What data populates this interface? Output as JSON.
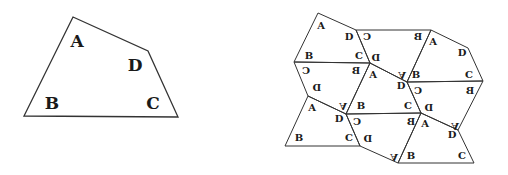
{
  "figure": {
    "colors": {
      "stroke": "#333333",
      "text": "#1a1a1a",
      "background": "#ffffff"
    }
  },
  "quadrilateral": {
    "points": [
      [
        73,
        17
      ],
      [
        148,
        51
      ],
      [
        178,
        117
      ],
      [
        24,
        116
      ]
    ],
    "labels": [
      {
        "text": "A",
        "x": 77,
        "y": 47,
        "size": 17,
        "rot": 0,
        "flipX": false
      },
      {
        "text": "D",
        "x": 135,
        "y": 71,
        "size": 17,
        "rot": 0,
        "flipX": false
      },
      {
        "text": "B",
        "x": 52,
        "y": 109,
        "size": 17,
        "rot": 0,
        "flipX": false
      },
      {
        "text": "C",
        "x": 153,
        "y": 109,
        "size": 17,
        "rot": 0,
        "flipX": false
      }
    ]
  },
  "tiling": {
    "tiles": [
      {
        "points": [
          [
            318,
            13
          ],
          [
            356,
            30
          ],
          [
            370,
            63
          ],
          [
            294,
            62
          ]
        ]
      },
      {
        "points": [
          [
            356,
            30
          ],
          [
            431,
            30
          ],
          [
            407,
            82
          ],
          [
            370,
            63
          ]
        ]
      },
      {
        "points": [
          [
            431,
            30
          ],
          [
            468,
            48
          ],
          [
            483,
            81
          ],
          [
            407,
            82
          ]
        ]
      },
      {
        "points": [
          [
            294,
            62
          ],
          [
            370,
            63
          ],
          [
            346,
            114
          ],
          [
            308,
            96
          ]
        ]
      },
      {
        "points": [
          [
            370,
            63
          ],
          [
            407,
            82
          ],
          [
            421,
            113
          ],
          [
            346,
            114
          ]
        ]
      },
      {
        "points": [
          [
            407,
            82
          ],
          [
            483,
            81
          ],
          [
            458,
            130
          ],
          [
            421,
            113
          ]
        ]
      },
      {
        "points": [
          [
            308,
            96
          ],
          [
            346,
            114
          ],
          [
            360,
            146
          ],
          [
            285,
            146
          ]
        ]
      },
      {
        "points": [
          [
            346,
            114
          ],
          [
            421,
            113
          ],
          [
            398,
            163
          ],
          [
            360,
            146
          ]
        ]
      },
      {
        "points": [
          [
            421,
            113
          ],
          [
            458,
            130
          ],
          [
            474,
            163
          ],
          [
            398,
            163
          ]
        ]
      }
    ],
    "labels": [
      {
        "text": "A",
        "x": 321,
        "y": 29,
        "size": 10,
        "rot": 0,
        "flipX": false
      },
      {
        "text": "D",
        "x": 349,
        "y": 40,
        "size": 10,
        "rot": 0,
        "flipX": false
      },
      {
        "text": "B",
        "x": 309,
        "y": 59,
        "size": 10,
        "rot": 0,
        "flipX": false
      },
      {
        "text": "C",
        "x": 359,
        "y": 59,
        "size": 10,
        "rot": 0,
        "flipX": false
      },
      {
        "text": "C",
        "x": 367,
        "y": 40,
        "size": 10,
        "rot": 0,
        "flipX": true
      },
      {
        "text": "B",
        "x": 418,
        "y": 40,
        "size": 10,
        "rot": 0,
        "flipX": true
      },
      {
        "text": "D",
        "x": 376,
        "y": 61,
        "size": 10,
        "rot": 0,
        "flipX": true
      },
      {
        "text": "A",
        "x": 402,
        "y": 72,
        "size": 10,
        "rot": 180,
        "flipX": true
      },
      {
        "text": "A",
        "x": 433,
        "y": 45,
        "size": 10,
        "rot": 0,
        "flipX": false
      },
      {
        "text": "D",
        "x": 462,
        "y": 56,
        "size": 10,
        "rot": 0,
        "flipX": false
      },
      {
        "text": "B",
        "x": 416,
        "y": 78,
        "size": 10,
        "rot": 0,
        "flipX": false
      },
      {
        "text": "C",
        "x": 469,
        "y": 78,
        "size": 10,
        "rot": 0,
        "flipX": false
      },
      {
        "text": "C",
        "x": 306,
        "y": 74,
        "size": 10,
        "rot": 0,
        "flipX": true
      },
      {
        "text": "B",
        "x": 356,
        "y": 74,
        "size": 10,
        "rot": 0,
        "flipX": true
      },
      {
        "text": "D",
        "x": 317,
        "y": 91,
        "size": 10,
        "rot": 0,
        "flipX": true
      },
      {
        "text": "A",
        "x": 343,
        "y": 103,
        "size": 10,
        "rot": 180,
        "flipX": true
      },
      {
        "text": "A",
        "x": 373,
        "y": 78,
        "size": 10,
        "rot": 0,
        "flipX": false
      },
      {
        "text": "D",
        "x": 401,
        "y": 89,
        "size": 10,
        "rot": 0,
        "flipX": false
      },
      {
        "text": "B",
        "x": 361,
        "y": 109,
        "size": 10,
        "rot": 0,
        "flipX": false
      },
      {
        "text": "C",
        "x": 408,
        "y": 109,
        "size": 10,
        "rot": 0,
        "flipX": false
      },
      {
        "text": "C",
        "x": 418,
        "y": 94,
        "size": 10,
        "rot": 0,
        "flipX": true
      },
      {
        "text": "B",
        "x": 470,
        "y": 94,
        "size": 10,
        "rot": 0,
        "flipX": true
      },
      {
        "text": "D",
        "x": 429,
        "y": 111,
        "size": 10,
        "rot": 0,
        "flipX": true
      },
      {
        "text": "A",
        "x": 455,
        "y": 123,
        "size": 10,
        "rot": 180,
        "flipX": true
      },
      {
        "text": "A",
        "x": 312,
        "y": 111,
        "size": 10,
        "rot": 0,
        "flipX": false
      },
      {
        "text": "D",
        "x": 339,
        "y": 122,
        "size": 10,
        "rot": 0,
        "flipX": false
      },
      {
        "text": "B",
        "x": 299,
        "y": 141,
        "size": 10,
        "rot": 0,
        "flipX": false
      },
      {
        "text": "C",
        "x": 349,
        "y": 141,
        "size": 10,
        "rot": 0,
        "flipX": false
      },
      {
        "text": "C",
        "x": 357,
        "y": 125,
        "size": 10,
        "rot": 0,
        "flipX": true
      },
      {
        "text": "B",
        "x": 411,
        "y": 125,
        "size": 10,
        "rot": 0,
        "flipX": true
      },
      {
        "text": "D",
        "x": 368,
        "y": 142,
        "size": 10,
        "rot": 0,
        "flipX": true
      },
      {
        "text": "A",
        "x": 394,
        "y": 154,
        "size": 10,
        "rot": 180,
        "flipX": true
      },
      {
        "text": "A",
        "x": 425,
        "y": 127,
        "size": 10,
        "rot": 0,
        "flipX": false
      },
      {
        "text": "D",
        "x": 452,
        "y": 138,
        "size": 10,
        "rot": 0,
        "flipX": false
      },
      {
        "text": "B",
        "x": 411,
        "y": 159,
        "size": 10,
        "rot": 0,
        "flipX": false
      },
      {
        "text": "C",
        "x": 462,
        "y": 159,
        "size": 10,
        "rot": 0,
        "flipX": false
      }
    ]
  }
}
